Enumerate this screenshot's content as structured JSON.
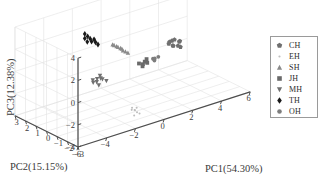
{
  "chart_data": {
    "type": "scatter",
    "projection": "3d",
    "title": "",
    "xlabel": "PC1(54.30%)",
    "ylabel": "PC2(15.15%)",
    "zlabel": "PC3(12.38%)",
    "xlim": [
      -6,
      6
    ],
    "ylim": [
      -3,
      3
    ],
    "zlim": [
      -4,
      4
    ],
    "xticks": [
      -6,
      -4,
      -2,
      0,
      2,
      4,
      6
    ],
    "yticks": [
      3,
      2,
      1,
      0,
      -1,
      -2,
      -3
    ],
    "zticks": [
      4,
      2,
      0,
      -2,
      -4
    ],
    "grid": true,
    "legend_position": "right-outside",
    "variance_explained": {
      "PC1": "54.30%",
      "PC2": "15.15%",
      "PC3": "12.38%"
    },
    "series": [
      {
        "name": "CH",
        "marker": "pentagon",
        "color": "#6f6f6f",
        "points": [
          {
            "x": 2.3,
            "y": -0.3,
            "z": 0.6
          },
          {
            "x": 2.5,
            "y": -0.4,
            "z": 0.4
          },
          {
            "x": 2.6,
            "y": -0.2,
            "z": 0.7
          },
          {
            "x": 2.8,
            "y": -0.5,
            "z": 0.3
          },
          {
            "x": 2.4,
            "y": -0.6,
            "z": 0.5
          },
          {
            "x": 2.7,
            "y": -0.3,
            "z": 0.8
          },
          {
            "x": 3.0,
            "y": -0.4,
            "z": 0.6
          },
          {
            "x": 2.9,
            "y": -0.6,
            "z": 0.2
          },
          {
            "x": 2.2,
            "y": -0.5,
            "z": 0.9
          },
          {
            "x": 3.1,
            "y": -0.2,
            "z": 0.4
          }
        ]
      },
      {
        "name": "EH",
        "marker": "dot",
        "color": "#bdbdbd",
        "points": [
          {
            "x": -1.4,
            "y": -2.1,
            "z": -3.0
          },
          {
            "x": -1.3,
            "y": -2.2,
            "z": -3.2
          },
          {
            "x": -1.5,
            "y": -2.0,
            "z": -2.8
          },
          {
            "x": -1.2,
            "y": -2.3,
            "z": -3.3
          },
          {
            "x": -1.6,
            "y": -2.1,
            "z": -2.9
          },
          {
            "x": -1.3,
            "y": -2.0,
            "z": -3.1
          },
          {
            "x": -1.5,
            "y": -2.2,
            "z": -3.4
          },
          {
            "x": -1.4,
            "y": -2.3,
            "z": -2.7
          }
        ]
      },
      {
        "name": "SH",
        "marker": "triangle-up",
        "color": "#8a8a8a",
        "points": [
          {
            "x": -1.1,
            "y": 0.4,
            "z": 1.6
          },
          {
            "x": -0.9,
            "y": 0.3,
            "z": 1.4
          },
          {
            "x": -0.7,
            "y": 0.2,
            "z": 1.2
          },
          {
            "x": -0.6,
            "y": 0.1,
            "z": 1.0
          },
          {
            "x": -0.5,
            "y": 0.0,
            "z": 0.9
          },
          {
            "x": -0.8,
            "y": 0.3,
            "z": 1.3
          },
          {
            "x": -0.4,
            "y": -0.1,
            "z": 0.8
          },
          {
            "x": -1.0,
            "y": 0.4,
            "z": 1.5
          },
          {
            "x": -0.6,
            "y": 0.2,
            "z": 1.1
          }
        ]
      },
      {
        "name": "JH",
        "marker": "square",
        "color": "#6a6a6a",
        "points": [
          {
            "x": 0.3,
            "y": -0.2,
            "z": -0.4
          },
          {
            "x": 0.5,
            "y": -0.3,
            "z": -0.5
          },
          {
            "x": 0.7,
            "y": -0.2,
            "z": -0.4
          },
          {
            "x": 0.9,
            "y": -0.1,
            "z": -0.3
          },
          {
            "x": 0.4,
            "y": -0.4,
            "z": -0.6
          },
          {
            "x": 0.8,
            "y": -0.3,
            "z": -0.5
          }
        ]
      },
      {
        "name": "MH",
        "marker": "triangle-down",
        "color": "#707070",
        "points": [
          {
            "x": -2.4,
            "y": 0.1,
            "z": -0.8
          },
          {
            "x": -2.5,
            "y": 0.0,
            "z": -1.0
          },
          {
            "x": -2.3,
            "y": -0.1,
            "z": -0.7
          },
          {
            "x": -2.6,
            "y": 0.2,
            "z": -1.1
          },
          {
            "x": -2.2,
            "y": 0.1,
            "z": -0.6
          },
          {
            "x": -2.5,
            "y": -0.2,
            "z": -1.2
          },
          {
            "x": -2.1,
            "y": 0.0,
            "z": -0.9
          },
          {
            "x": -2.7,
            "y": 0.1,
            "z": -0.8
          },
          {
            "x": -1.9,
            "y": -0.1,
            "z": -1.1
          }
        ]
      },
      {
        "name": "TH",
        "marker": "diamond-filled",
        "color": "#1a1a1a",
        "points": [
          {
            "x": -2.6,
            "y": 1.0,
            "z": 2.9
          },
          {
            "x": -2.6,
            "y": 1.0,
            "z": 2.5
          },
          {
            "x": -2.5,
            "y": 0.9,
            "z": 2.2
          },
          {
            "x": -2.3,
            "y": 0.9,
            "z": 2.4
          },
          {
            "x": -2.1,
            "y": 0.8,
            "z": 2.3
          },
          {
            "x": -2.0,
            "y": 0.8,
            "z": 2.0
          },
          {
            "x": -1.9,
            "y": 0.7,
            "z": 1.8
          },
          {
            "x": -2.2,
            "y": 0.9,
            "z": 2.1
          },
          {
            "x": -2.4,
            "y": 1.0,
            "z": 2.6
          }
        ]
      },
      {
        "name": "OH",
        "marker": "circle",
        "color": "#7d7d7d",
        "points": [
          {
            "x": 1.2,
            "y": -0.3,
            "z": -0.3
          },
          {
            "x": 1.4,
            "y": -0.2,
            "z": -0.4
          },
          {
            "x": 1.5,
            "y": -0.4,
            "z": -0.2
          },
          {
            "x": 1.3,
            "y": -0.3,
            "z": -0.5
          }
        ]
      }
    ]
  },
  "legend": {
    "items": [
      {
        "label": "CH",
        "marker": "pentagon-icon"
      },
      {
        "label": "EH",
        "marker": "dot-icon"
      },
      {
        "label": "SH",
        "marker": "triangle-up-icon"
      },
      {
        "label": "JH",
        "marker": "square-icon"
      },
      {
        "label": "MH",
        "marker": "triangle-down-icon"
      },
      {
        "label": "TH",
        "marker": "diamond-filled-icon"
      },
      {
        "label": "OH",
        "marker": "circle-icon"
      }
    ]
  },
  "axes": {
    "z": {
      "label": "PC3(12.38%)",
      "ticks": [
        "4",
        "2",
        "0",
        "−2",
        "−4"
      ]
    },
    "y": {
      "label": "PC2(15.15%)",
      "ticks": [
        "3",
        "2",
        "1",
        "0",
        "−1",
        "−2",
        "−3"
      ]
    },
    "x": {
      "label": "PC1(54.30%)",
      "ticks": [
        "−6",
        "−4",
        "−2",
        "0",
        "2",
        "4",
        "6"
      ]
    }
  },
  "style": {
    "background": "#ffffff",
    "grid_color": "#e2e2e2",
    "axis_color": "#4d4d4d",
    "text_color": "#3a3a3a"
  }
}
